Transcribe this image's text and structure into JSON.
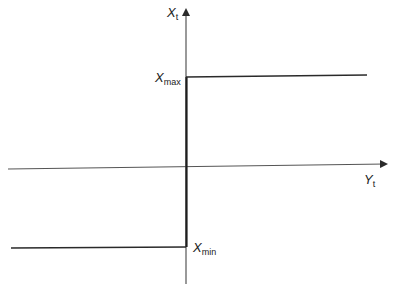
{
  "diagram": {
    "type": "step-function",
    "axes": {
      "vertical": {
        "label": "X",
        "subscript": "t"
      },
      "horizontal": {
        "label": "Y",
        "subscript": "t"
      }
    },
    "levels": {
      "max": {
        "label": "X",
        "subscript": "max"
      },
      "min": {
        "label": "X",
        "subscript": "min"
      }
    },
    "colors": {
      "line": "#2a2a2a",
      "background": "#ffffff"
    }
  }
}
